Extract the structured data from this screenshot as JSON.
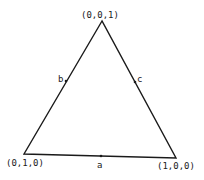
{
  "diagram": {
    "type": "simplex-triangle",
    "vertices": {
      "top": {
        "label": "(0,0,1)",
        "x": 102,
        "y": 21
      },
      "bottom_left": {
        "label": "(0,1,0)",
        "x": 24,
        "y": 154
      },
      "bottom_right": {
        "label": "(1,0,0)",
        "x": 176,
        "y": 158
      }
    },
    "edge_points": {
      "a": {
        "label": "a",
        "x": 101,
        "y": 156
      },
      "b": {
        "label": "b",
        "x": 66,
        "y": 81
      },
      "c": {
        "label": "c",
        "x": 135,
        "y": 82
      }
    },
    "colors": {
      "stroke": "#1a1a1a",
      "background": "#ffffff"
    }
  }
}
